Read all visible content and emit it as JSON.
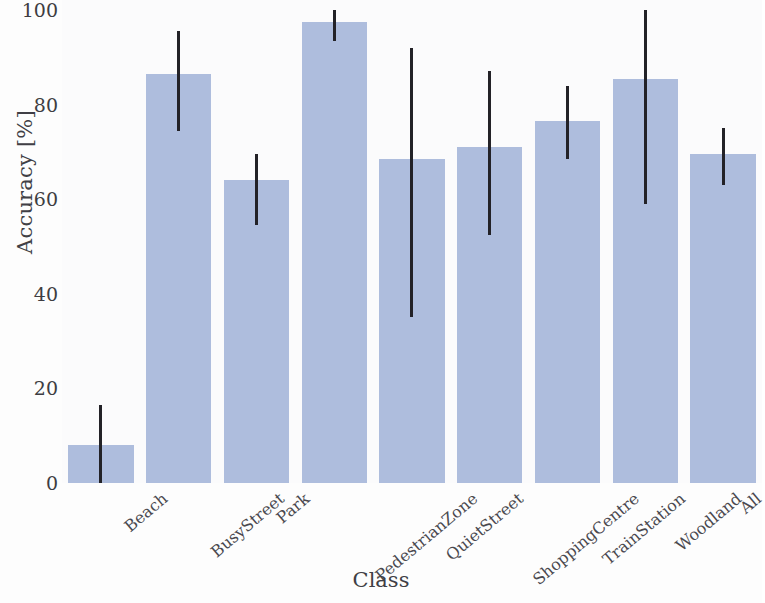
{
  "chart_data": {
    "type": "bar",
    "title": "",
    "xlabel": "Class",
    "ylabel": "Accuracy [%]",
    "ylim": [
      0,
      100
    ],
    "yticks": [
      0,
      20,
      40,
      60,
      80,
      100
    ],
    "grid": false,
    "legend": "none",
    "bar_color": "#aebddd",
    "errorbar_color": "#232227",
    "categories": [
      "Beach",
      "BusyStreet",
      "Park",
      "PedestrianZone",
      "QuietStreet",
      "ShoppingCentre",
      "TrainStation",
      "Woodland",
      "All"
    ],
    "values": [
      8,
      86.5,
      64,
      97.5,
      68.5,
      71,
      76.5,
      85.5,
      69.5
    ],
    "errorbar_low": [
      0,
      74.5,
      54.5,
      93.5,
      35,
      52.5,
      68.5,
      59,
      63
    ],
    "errorbar_high": [
      16.5,
      95.5,
      69.5,
      100,
      92,
      87,
      84,
      100,
      75
    ],
    "series": [
      {
        "name": "Accuracy",
        "values": [
          8,
          86.5,
          64,
          97.5,
          68.5,
          71,
          76.5,
          85.5,
          69.5
        ]
      }
    ]
  }
}
